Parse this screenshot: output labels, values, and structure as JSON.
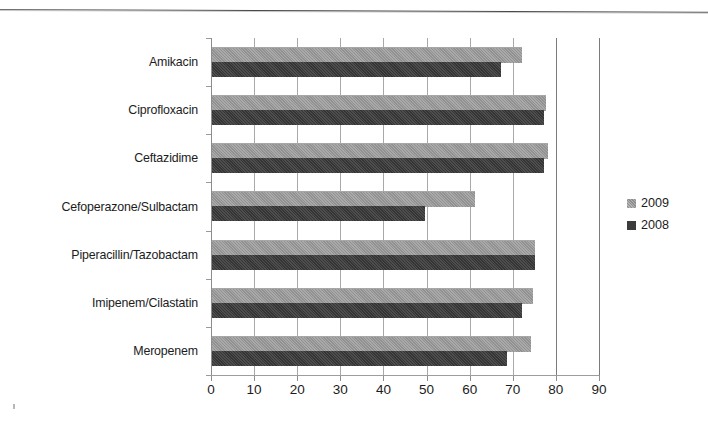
{
  "chart_data": {
    "type": "bar",
    "orientation": "horizontal",
    "title": "",
    "subtitle": "",
    "xlabel": "",
    "ylabel": "",
    "xlim": [
      0,
      90
    ],
    "ylim": null,
    "grid": true,
    "grid_axis": "x",
    "legend_position": "right",
    "xticks": [
      "0",
      "10",
      "20",
      "30",
      "40",
      "50",
      "60",
      "70",
      "80",
      "90"
    ],
    "xtick_values": [
      0,
      10,
      20,
      30,
      40,
      50,
      60,
      70,
      80,
      90
    ],
    "categories": [
      "Amikacin",
      "Ciprofloxacin",
      "Ceftazidime",
      "Cefoperazone/Sulbactam",
      "Piperacillin/Tazobactam",
      "Imipenem/Cilastatin",
      "Meropenem"
    ],
    "series": [
      {
        "name": "2009",
        "color": "#999999",
        "values": [
          72,
          77.5,
          78,
          61,
          75,
          74.5,
          74
        ]
      },
      {
        "name": "2008",
        "color": "#3c3c3c",
        "values": [
          67,
          77,
          77,
          49.5,
          75,
          72,
          68.5
        ]
      }
    ],
    "legend": [
      {
        "label": "2009",
        "color": "#999999"
      },
      {
        "label": "2008",
        "color": "#3c3c3c"
      }
    ]
  }
}
